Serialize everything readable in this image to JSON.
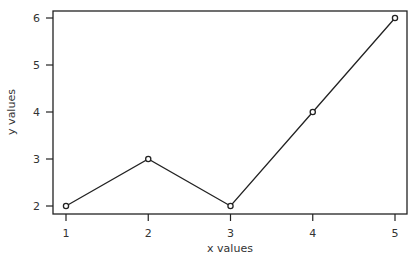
{
  "chart_data": {
    "type": "line",
    "title": "",
    "xlabel": "x values",
    "ylabel": "y values",
    "x": [
      1,
      2,
      3,
      4,
      5
    ],
    "series": [
      {
        "name": "y",
        "values": [
          2,
          3,
          2,
          4,
          6
        ],
        "color": "#222222",
        "marker": "open-circle"
      }
    ],
    "xlim": [
      1,
      5
    ],
    "ylim": [
      2,
      6
    ],
    "xticks": [
      "1",
      "2",
      "3",
      "4",
      "5"
    ],
    "yticks": [
      "2",
      "3",
      "4",
      "5",
      "6"
    ],
    "grid": false,
    "legend": null
  },
  "plot": {
    "frame": {
      "left": 53,
      "top": 11,
      "right": 407,
      "bottom": 214
    },
    "x_pixel": {
      "min_value": 1,
      "min_px": 66,
      "max_value": 5,
      "max_px": 395
    },
    "y_pixel": {
      "min_value": 2,
      "min_px": 206,
      "max_value": 6,
      "max_px": 18
    },
    "line_color": "#222222",
    "frame_color": "#222222"
  }
}
